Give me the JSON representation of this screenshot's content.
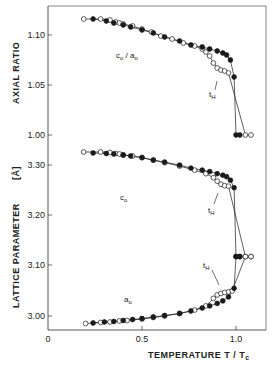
{
  "chart_data": [
    {
      "type": "scatter",
      "title": "",
      "ylabel": "AXIAL RATIO",
      "xlabel": "TEMPERATURE T / Tc",
      "xlim": [
        0,
        1.12
      ],
      "ylim": [
        0.995,
        1.13
      ],
      "yticks": [
        "1.00",
        "1.05",
        "1.10"
      ],
      "grid": false,
      "annotations": [
        "c0 / a0",
        "tH"
      ],
      "series": [
        {
          "name": "c0/a0 open circles",
          "marker": "open-circle",
          "x": [
            0.19,
            0.28,
            0.33,
            0.36,
            0.38,
            0.4,
            0.45,
            0.5,
            0.55,
            0.6,
            0.66,
            0.72,
            0.78,
            0.82,
            0.84,
            0.86,
            0.88,
            0.9,
            0.92,
            0.94,
            0.96,
            1.05,
            1.08
          ],
          "y": [
            1.116,
            1.116,
            1.115,
            1.113,
            1.112,
            1.111,
            1.109,
            1.106,
            1.103,
            1.099,
            1.096,
            1.092,
            1.089,
            1.086,
            1.083,
            1.079,
            1.072,
            1.067,
            1.065,
            1.064,
            1.062,
            1.0,
            1.0
          ]
        },
        {
          "name": "c0/a0 filled circles",
          "marker": "filled-circle",
          "x": [
            0.24,
            0.31,
            0.35,
            0.4,
            0.44,
            0.5,
            0.56,
            0.62,
            0.7,
            0.76,
            0.82,
            0.86,
            0.9,
            0.93,
            0.95,
            0.97,
            0.99,
            1.0,
            1.02
          ],
          "y": [
            1.116,
            1.114,
            1.112,
            1.11,
            1.108,
            1.105,
            1.102,
            1.098,
            1.094,
            1.09,
            1.088,
            1.086,
            1.084,
            1.082,
            1.08,
            1.075,
            1.058,
            1.0,
            1.0
          ]
        }
      ]
    },
    {
      "type": "scatter",
      "title": "",
      "ylabel": "LATTICE PARAMETER [Å]",
      "xlabel": "TEMPERATURE T / Tc",
      "xlim": [
        0,
        1.12
      ],
      "ylim": [
        2.97,
        3.35
      ],
      "xticks": [
        "0",
        "0.5",
        "1.0"
      ],
      "yticks": [
        "3.00",
        "3.10",
        "3.20",
        "3.30"
      ],
      "grid": false,
      "annotations": [
        "c0",
        "a0",
        "tH",
        "tH"
      ],
      "series": [
        {
          "name": "c0 open circles",
          "marker": "open-circle",
          "x": [
            0.19,
            0.28,
            0.33,
            0.36,
            0.38,
            0.4,
            0.45,
            0.5,
            0.56,
            0.62,
            0.7,
            0.78,
            0.84,
            0.88,
            0.9,
            0.92,
            0.94,
            0.96,
            1.05,
            1.08
          ],
          "y": [
            3.326,
            3.326,
            3.325,
            3.323,
            3.322,
            3.32,
            3.318,
            3.315,
            3.31,
            3.305,
            3.298,
            3.29,
            3.283,
            3.275,
            3.268,
            3.262,
            3.259,
            3.258,
            3.118,
            3.118
          ]
        },
        {
          "name": "c0 filled circles",
          "marker": "filled-circle",
          "x": [
            0.24,
            0.31,
            0.35,
            0.4,
            0.44,
            0.5,
            0.56,
            0.62,
            0.7,
            0.76,
            0.82,
            0.86,
            0.9,
            0.93,
            0.95,
            0.97,
            0.99,
            1.0,
            1.02
          ],
          "y": [
            3.324,
            3.323,
            3.322,
            3.32,
            3.318,
            3.315,
            3.31,
            3.306,
            3.3,
            3.294,
            3.29,
            3.287,
            3.283,
            3.28,
            3.277,
            3.27,
            3.255,
            3.118,
            3.118
          ]
        },
        {
          "name": "a0 open circles",
          "marker": "open-circle",
          "x": [
            0.2,
            0.28,
            0.33,
            0.38,
            0.42,
            0.5,
            0.56,
            0.62,
            0.7,
            0.78,
            0.84,
            0.88,
            0.9,
            0.92,
            0.94,
            0.96,
            0.98,
            1.05,
            1.08
          ],
          "y": [
            2.985,
            2.987,
            2.988,
            2.99,
            2.991,
            2.994,
            2.997,
            3.0,
            3.005,
            3.012,
            3.02,
            3.035,
            3.042,
            3.045,
            3.047,
            3.048,
            3.05,
            3.118,
            3.118
          ]
        },
        {
          "name": "a0 filled circles",
          "marker": "filled-circle",
          "x": [
            0.24,
            0.3,
            0.35,
            0.4,
            0.45,
            0.5,
            0.56,
            0.62,
            0.7,
            0.76,
            0.82,
            0.86,
            0.9,
            0.93,
            0.96,
            0.99,
            1.0,
            1.02
          ],
          "y": [
            2.986,
            2.988,
            2.989,
            2.991,
            2.993,
            2.995,
            2.998,
            3.001,
            3.005,
            3.01,
            3.016,
            3.02,
            3.025,
            3.03,
            3.038,
            3.055,
            3.118,
            3.118
          ]
        }
      ]
    }
  ],
  "labels": {
    "upper_ylabel": "AXIAL  RATIO",
    "lower_ylabel": "LATTICE  PARAMETER",
    "lower_yunit": "[Å]",
    "xlabel": "TEMPERATURE  T / T",
    "xlabel_sub": "c",
    "ratio_label": "c",
    "ratio_label_sub": "o",
    "ratio_label_mid": " / a",
    "c0_label": "c",
    "a0_label": "a",
    "sub_o": "o",
    "tH_label": "t",
    "tH_sub": "H",
    "upper_yticks": [
      "1.10",
      "1.05",
      "1.00"
    ],
    "lower_yticks": [
      "3.30",
      "3.20",
      "3.10",
      "3.00"
    ],
    "xticks": [
      "0",
      "0.5",
      "1.0"
    ]
  },
  "colors": {
    "ink": "#1a1a1a",
    "frame": "#555555",
    "background": "#ffffff"
  }
}
